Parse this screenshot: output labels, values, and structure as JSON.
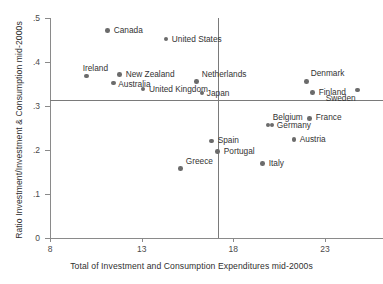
{
  "chart_data": {
    "type": "scatter",
    "title": "",
    "xlabel": "Total of Investment and Consumption Expenditures mid-2000s",
    "ylabel": "Ratio Investment/Investment & Consumption mid-2000s",
    "xlim": [
      8,
      23.9
    ],
    "ylim": [
      0,
      0.5
    ],
    "xticks": [
      8,
      13,
      18,
      23
    ],
    "xticklabels": [
      "8",
      "13",
      "18",
      "23"
    ],
    "yticks": [
      0,
      0.1,
      0.2,
      0.3,
      0.4,
      0.5
    ],
    "yticklabels": [
      "0",
      ".1",
      ".2",
      ".3",
      ".4",
      ".5"
    ],
    "grid": false,
    "legend": null,
    "marker_color": "#6b6b6b",
    "reference_lines": {
      "horizontal": 0.313,
      "vertical": 17.15
    },
    "points": [
      {
        "label": "Canada",
        "x": 11.15,
        "y": 0.472,
        "label_dx": 6,
        "label_dy": -4
      },
      {
        "label": "United States",
        "x": 14.32,
        "y": 0.452,
        "label_dx": 6,
        "label_dy": -4
      },
      {
        "label": "Ireland",
        "x": 10.0,
        "y": 0.368,
        "label_dx": -4,
        "label_dy": -12
      },
      {
        "label": "New Zealand",
        "x": 11.8,
        "y": 0.372,
        "label_dx": 6,
        "label_dy": -4
      },
      {
        "label": "Australia",
        "x": 11.45,
        "y": 0.352,
        "label_dx": 5,
        "label_dy": -3
      },
      {
        "label": "United Kingdom",
        "x": 13.07,
        "y": 0.339,
        "label_dx": 6,
        "label_dy": -4
      },
      {
        "label": "Netherlands",
        "x": 16.0,
        "y": 0.356,
        "label_dx": 5,
        "label_dy": -11
      },
      {
        "label": "Japan",
        "x": 16.28,
        "y": 0.33,
        "label_dx": 5,
        "label_dy": -4
      },
      {
        "label": "Denmark",
        "x": 22.0,
        "y": 0.356,
        "label_dx": 4,
        "label_dy": -12
      },
      {
        "label": "Finland",
        "x": 22.33,
        "y": 0.331,
        "label_dx": 6,
        "label_dy": -4
      },
      {
        "label": "Sweden",
        "x": 24.78,
        "y": 0.336,
        "label_dx": -32,
        "label_dy": 4
      },
      {
        "label": "Belgium",
        "x": 19.88,
        "y": 0.257,
        "label_dx": 0,
        "label_dy": -12
      },
      {
        "label": "Germany",
        "x": 20.1,
        "y": 0.257,
        "label_dx": 5,
        "label_dy": -4
      },
      {
        "label": "France",
        "x": 22.17,
        "y": 0.272,
        "label_dx": 6,
        "label_dy": -5
      },
      {
        "label": "Austria",
        "x": 21.3,
        "y": 0.224,
        "label_dx": 6,
        "label_dy": -4
      },
      {
        "label": "Spain",
        "x": 16.82,
        "y": 0.22,
        "label_dx": 6,
        "label_dy": -5
      },
      {
        "label": "Portugal",
        "x": 17.15,
        "y": 0.197,
        "label_dx": 6,
        "label_dy": -4
      },
      {
        "label": "Greece",
        "x": 15.13,
        "y": 0.158,
        "label_dx": 5,
        "label_dy": -11
      },
      {
        "label": "Italy",
        "x": 19.6,
        "y": 0.169,
        "label_dx": 6,
        "label_dy": -5
      }
    ]
  }
}
